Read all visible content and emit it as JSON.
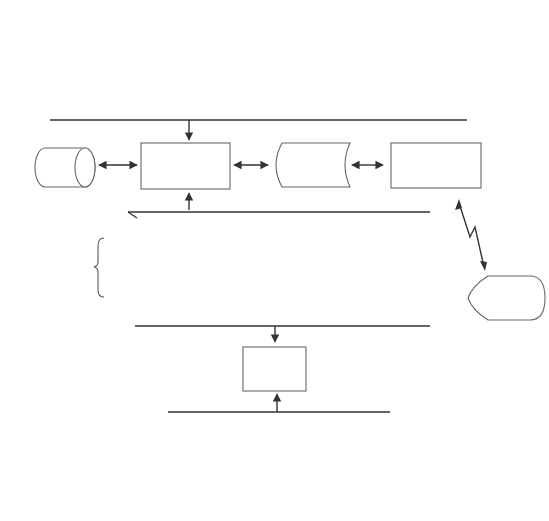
{
  "top_departments": [
    {
      "header": [
        "Sales"
      ],
      "document": [
        "Forecasts",
        "and orders"
      ]
    },
    {
      "header": [
        "Production",
        "Planning"
      ],
      "document": [
        "Production",
        "orders",
        "and schedules"
      ]
    },
    {
      "header": [
        "Engineering"
      ],
      "document": [
        "Product",
        "specifications"
      ]
    },
    {
      "header": [
        "Cost",
        "Accounting"
      ],
      "document": [
        "Standard costs",
        "and overhead",
        "rates"
      ]
    },
    {
      "header": [
        "Inventory"
      ],
      "document": [
        "Materials",
        "requisitions"
      ]
    },
    {
      "header": [
        "Factory",
        "Workstations"
      ],
      "document": [
        "Production",
        "data"
      ]
    }
  ],
  "middle": {
    "general_ledger": [
      "General",
      "ledger"
    ],
    "online_system": [
      "Online production",
      "information",
      "system"
    ],
    "mfg_specs": [
      "Manufacturing",
      "control",
      "specifications"
    ],
    "cim": [
      "CIM",
      "interface"
    ]
  },
  "database": {
    "label": [
      "Production",
      "cycle",
      "database"
    ],
    "files": [
      [
        "Bill of",
        "materials"
      ],
      [
        "Operations",
        "list"
      ],
      [
        "Master",
        "production",
        "schedule"
      ],
      [
        "Inventory"
      ],
      [
        "Production",
        "orders"
      ],
      [
        "Work",
        "in process"
      ]
    ]
  },
  "factory": {
    "link_label": [
      "Factory",
      "workstations"
    ],
    "display": [
      "Instructions",
      "and",
      "schedules"
    ]
  },
  "inquiry": [
    "Inquiry",
    "processing",
    "system"
  ],
  "reports": [
    {
      "display": [
        "Production",
        "status",
        "reports"
      ],
      "footer": [
        "Sales"
      ]
    },
    {
      "display": [
        "Production",
        "status",
        "reports"
      ],
      "footer": [
        "Production",
        "Planning"
      ]
    },
    {
      "display": [
        "Cost",
        "analyses"
      ],
      "footer": [
        "Cost",
        "Accounting"
      ]
    },
    {
      "display": [
        "Performance",
        "reports"
      ],
      "footer": [
        "Factory",
        "Supervisors"
      ]
    }
  ]
}
